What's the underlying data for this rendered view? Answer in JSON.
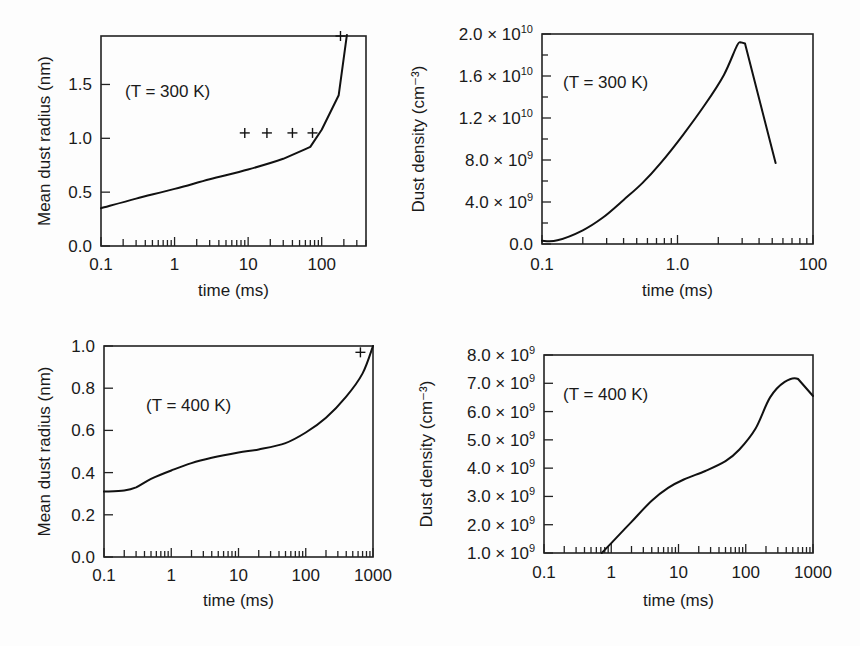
{
  "chart_data": [
    {
      "id": "top-left",
      "type": "line",
      "title": "",
      "annotation": "(T = 300 K)",
      "xlabel": "time (ms)",
      "ylabel": "Mean dust radius (nm)",
      "xscale": "log",
      "xlim": [
        0.1,
        400
      ],
      "ylim": [
        0.0,
        1.95
      ],
      "xticks": [
        {
          "v": 0.1,
          "label": "0.1"
        },
        {
          "v": 1,
          "label": "1"
        },
        {
          "v": 10,
          "label": "10"
        },
        {
          "v": 100,
          "label": "100"
        }
      ],
      "yticks": [
        {
          "v": 0.0,
          "label": "0.0"
        },
        {
          "v": 0.5,
          "label": "0.5"
        },
        {
          "v": 1.0,
          "label": "1.0"
        },
        {
          "v": 1.5,
          "label": "1.5"
        }
      ],
      "series": [
        {
          "name": "model",
          "style": "line",
          "x": [
            0.1,
            0.3,
            1,
            3,
            10,
            30,
            60,
            70,
            100,
            170,
            220
          ],
          "y": [
            0.35,
            0.44,
            0.53,
            0.62,
            0.71,
            0.81,
            0.9,
            0.92,
            1.08,
            1.4,
            1.96
          ]
        },
        {
          "name": "measured",
          "style": "plus",
          "x": [
            9,
            18,
            40,
            75,
            180
          ],
          "y": [
            1.05,
            1.05,
            1.05,
            1.05,
            1.95
          ]
        }
      ]
    },
    {
      "id": "top-right",
      "type": "line",
      "title": "",
      "annotation": "(T = 300 K)",
      "xlabel": "time (ms)",
      "ylabel": "Dust density (cm⁻³)",
      "xscale": "log",
      "xlim": [
        0.1,
        10
      ],
      "ylim": [
        0,
        20000000000.0
      ],
      "xticks": [
        {
          "v": 0.1,
          "label": "0.1"
        },
        {
          "v": 1,
          "label": "1.0"
        },
        {
          "v": 10,
          "label": "100"
        }
      ],
      "yticks": [
        {
          "v": 0,
          "label": "0.0",
          "mant": "0.0",
          "exp": ""
        },
        {
          "v": 4000000000.0,
          "mant": "4.0",
          "exp": "9"
        },
        {
          "v": 8000000000.0,
          "mant": "8.0",
          "exp": "9"
        },
        {
          "v": 12000000000.0,
          "mant": "1.2",
          "exp": "10"
        },
        {
          "v": 16000000000.0,
          "mant": "1.6",
          "exp": "10"
        },
        {
          "v": 20000000000.0,
          "mant": "2.0",
          "exp": "10"
        }
      ],
      "series": [
        {
          "name": "model",
          "style": "line",
          "x": [
            0.1,
            0.13,
            0.2,
            0.28,
            0.4,
            0.55,
            0.75,
            1.1,
            1.6,
            2.2,
            2.75,
            2.95,
            3.15,
            5.3
          ],
          "y": [
            300000000.0,
            350000000.0,
            1300000000.0,
            2500000000.0,
            4200000000.0,
            5800000000.0,
            7700000000.0,
            10400000000.0,
            13300000000.0,
            16100000000.0,
            18900000000.0,
            19200000000.0,
            19100000000.0,
            7700000000.0
          ]
        }
      ]
    },
    {
      "id": "bottom-left",
      "type": "line",
      "title": "",
      "annotation": "(T = 400 K)",
      "xlabel": "time (ms)",
      "ylabel": "Mean dust radius (nm)",
      "xscale": "log",
      "xlim": [
        0.1,
        1000
      ],
      "ylim": [
        0.0,
        1.0
      ],
      "xticks": [
        {
          "v": 0.1,
          "label": "0.1"
        },
        {
          "v": 1,
          "label": "1"
        },
        {
          "v": 10,
          "label": "10"
        },
        {
          "v": 100,
          "label": "100"
        },
        {
          "v": 1000,
          "label": "1000"
        }
      ],
      "yticks": [
        {
          "v": 0.0,
          "label": "0.0"
        },
        {
          "v": 0.2,
          "label": "0.2"
        },
        {
          "v": 0.4,
          "label": "0.4"
        },
        {
          "v": 0.6,
          "label": "0.6"
        },
        {
          "v": 0.8,
          "label": "0.8"
        },
        {
          "v": 1.0,
          "label": "1.0"
        }
      ],
      "series": [
        {
          "name": "model",
          "style": "line",
          "x": [
            0.1,
            0.2,
            0.3,
            0.5,
            1,
            2,
            4,
            10,
            20,
            50,
            100,
            200,
            400,
            700,
            1000
          ],
          "y": [
            0.31,
            0.315,
            0.33,
            0.37,
            0.41,
            0.445,
            0.47,
            0.495,
            0.51,
            0.54,
            0.59,
            0.66,
            0.76,
            0.87,
            1.0
          ]
        },
        {
          "name": "measured",
          "style": "plus",
          "x": [
            650
          ],
          "y": [
            0.97
          ]
        }
      ]
    },
    {
      "id": "bottom-right",
      "type": "line",
      "title": "",
      "annotation": "(T = 400 K)",
      "xlabel": "time (ms)",
      "ylabel": "Dust density (cm⁻³)",
      "xscale": "log",
      "xlim": [
        0.1,
        1000
      ],
      "ylim": [
        1000000000.0,
        8000000000.0
      ],
      "xticks": [
        {
          "v": 0.1,
          "label": "0.1"
        },
        {
          "v": 1,
          "label": "1"
        },
        {
          "v": 10,
          "label": "10"
        },
        {
          "v": 100,
          "label": "100"
        },
        {
          "v": 1000,
          "label": "1000"
        }
      ],
      "yticks": [
        {
          "v": 1000000000.0,
          "mant": "1.0",
          "exp": "9"
        },
        {
          "v": 2000000000.0,
          "mant": "2.0",
          "exp": "9"
        },
        {
          "v": 3000000000.0,
          "mant": "3.0",
          "exp": "9"
        },
        {
          "v": 4000000000.0,
          "mant": "4.0",
          "exp": "9"
        },
        {
          "v": 5000000000.0,
          "mant": "5.0",
          "exp": "9"
        },
        {
          "v": 6000000000.0,
          "mant": "6.0",
          "exp": "9"
        },
        {
          "v": 7000000000.0,
          "mant": "7.0",
          "exp": "9"
        },
        {
          "v": 8000000000.0,
          "mant": "8.0",
          "exp": "9"
        }
      ],
      "series": [
        {
          "name": "model",
          "style": "line",
          "x": [
            0.72,
            1.0,
            2.0,
            4.0,
            7.0,
            12,
            25,
            50,
            80,
            140,
            230,
            380,
            600,
            1000
          ],
          "y": [
            1000000000.0,
            1350000000.0,
            2100000000.0,
            2850000000.0,
            3300000000.0,
            3600000000.0,
            3900000000.0,
            4250000000.0,
            4650000000.0,
            5400000000.0,
            6500000000.0,
            7050000000.0,
            7150000000.0,
            6550000000.0
          ]
        }
      ]
    }
  ],
  "panels_layout": [
    {
      "plot": {
        "left": 101,
        "top": 36,
        "right": 366,
        "bottom": 246
      },
      "ylabel_x": 44,
      "xlabel_y": 296,
      "annot_x": 125,
      "annot_y": 97,
      "ytick_x": 92,
      "xtick_y": 270
    },
    {
      "plot": {
        "left": 542,
        "top": 34,
        "right": 813,
        "bottom": 244
      },
      "ylabel_x": 418,
      "xlabel_y": 296,
      "annot_x": 563,
      "annot_y": 88,
      "ytick_x": 533,
      "xtick_y": 270
    },
    {
      "plot": {
        "left": 104,
        "top": 346,
        "right": 373,
        "bottom": 557
      },
      "ylabel_x": 44,
      "xlabel_y": 606,
      "annot_x": 146,
      "annot_y": 411,
      "ytick_x": 95,
      "xtick_y": 581
    },
    {
      "plot": {
        "left": 544,
        "top": 355,
        "right": 813,
        "bottom": 553
      },
      "ylabel_x": 426,
      "xlabel_y": 606,
      "annot_x": 563,
      "annot_y": 400,
      "ytick_x": 535,
      "xtick_y": 578
    }
  ]
}
